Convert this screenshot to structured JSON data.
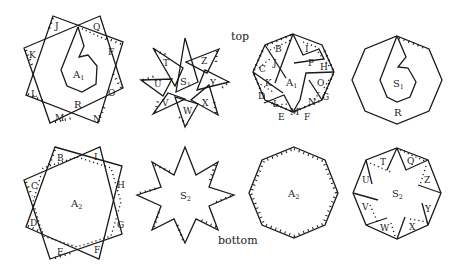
{
  "captions": {
    "top": "top",
    "bottom": "bottom"
  },
  "top_row": {
    "fig1": {
      "region_labels": {
        "center": "A",
        "center_sub": "1",
        "ring": "R"
      },
      "flaps": [
        "J",
        "Q",
        "K",
        "F",
        "L",
        "O",
        "M",
        "N"
      ]
    },
    "fig2": {
      "region_labels": {
        "center": "S",
        "center_sub": "1"
      },
      "flaps": [
        "T",
        "Z",
        "U",
        "Y",
        "V",
        "X",
        "W"
      ]
    },
    "fig3": {
      "region_labels": {
        "center": "A",
        "center_sub": "1"
      },
      "flaps": [
        "B",
        "I",
        "J",
        "P",
        "H",
        "C",
        "K",
        "O",
        "G",
        "D",
        "L",
        "N",
        "M",
        "E",
        "F"
      ]
    },
    "fig4": {
      "region_labels": {
        "center": "S",
        "center_sub": "1",
        "ring": "R"
      }
    }
  },
  "bottom_row": {
    "fig1": {
      "region_labels": {
        "center": "A",
        "center_sub": "2"
      },
      "flaps": [
        "B",
        "I",
        "C",
        "H",
        "D",
        "G",
        "E",
        "F"
      ]
    },
    "fig2": {
      "region_labels": {
        "center": "S",
        "center_sub": "2"
      }
    },
    "fig3": {
      "region_labels": {
        "center": "A",
        "center_sub": "2"
      }
    },
    "fig4": {
      "region_labels": {
        "center": "S",
        "center_sub": "2"
      },
      "flaps": [
        "T",
        "Q",
        "U",
        "Z",
        "V",
        "Y",
        "W",
        "X"
      ]
    }
  }
}
